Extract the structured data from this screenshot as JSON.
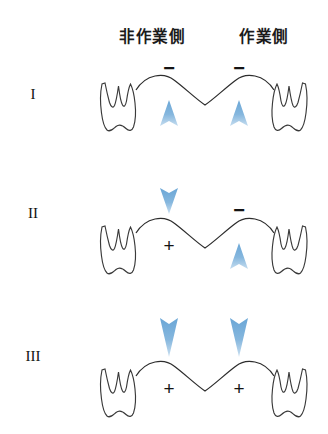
{
  "figure": {
    "title_caption_partial": "",
    "columns": [
      {
        "id": "nonworking",
        "label": "非作業側"
      },
      {
        "id": "working",
        "label": "作業側"
      }
    ],
    "rows": [
      {
        "label": "I",
        "sides": [
          {
            "side": "nonworking",
            "sign": "−",
            "sign_position": "above",
            "arrow": "up",
            "arrow_position": "below"
          },
          {
            "side": "working",
            "sign": "−",
            "sign_position": "above",
            "arrow": "up",
            "arrow_position": "below"
          }
        ]
      },
      {
        "label": "II",
        "sides": [
          {
            "side": "nonworking",
            "sign": "+",
            "sign_position": "below",
            "arrow": "down",
            "arrow_position": "above"
          },
          {
            "side": "working",
            "sign": "−",
            "sign_position": "above",
            "arrow": "up",
            "arrow_position": "below"
          }
        ]
      },
      {
        "label": "III",
        "sides": [
          {
            "side": "nonworking",
            "sign": "+",
            "sign_position": "below",
            "arrow": "down",
            "arrow_position": "above"
          },
          {
            "side": "working",
            "sign": "+",
            "sign_position": "below",
            "arrow": "down",
            "arrow_position": "above"
          }
        ]
      }
    ],
    "icons": {
      "tooth": "molar-tooth-outline",
      "arch": "bridge-pontic-arch",
      "arrow_up": "arrow-up-icon",
      "arrow_down": "arrow-down-icon"
    },
    "colors": {
      "arrow": "#7FB3DC",
      "arrow_edge": "#5E9BCF",
      "outline": "#2d2d2d",
      "text": "#141414",
      "background": "#ffffff"
    }
  }
}
